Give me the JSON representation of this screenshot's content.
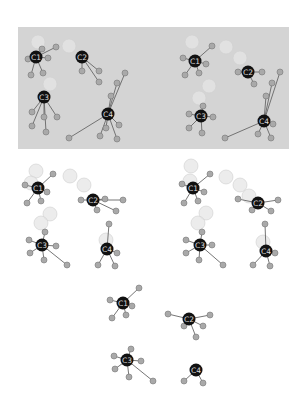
{
  "colors": {
    "panel_bg": "#d4d4d4",
    "center_node": "#111111",
    "leaf_node": "#a9a9a9",
    "leaf_stroke": "#777777",
    "edge": "#666666",
    "ghost_node": "#e6e6e6",
    "label": "#dddddd"
  },
  "clusters": [
    {
      "panel": "top-left",
      "label": "C1",
      "cx": 36,
      "cy": 57,
      "ghost": [
        [
          38,
          42
        ]
      ],
      "leaves": [
        [
          56,
          47
        ],
        [
          28,
          59
        ],
        [
          48,
          58
        ],
        [
          31,
          75
        ],
        [
          43,
          73
        ],
        [
          42,
          49
        ]
      ]
    },
    {
      "panel": "top-left",
      "label": "C2",
      "cx": 82,
      "cy": 57,
      "ghost": [
        [
          69,
          46
        ]
      ],
      "leaves": [
        [
          82,
          71
        ],
        [
          99,
          71
        ],
        [
          99,
          82
        ]
      ]
    },
    {
      "panel": "top-left",
      "label": "C3",
      "cx": 44,
      "cy": 97,
      "ghost": [
        [
          50,
          84
        ]
      ],
      "leaves": [
        [
          32,
          112
        ],
        [
          44,
          117
        ],
        [
          57,
          117
        ],
        [
          32,
          126
        ],
        [
          46,
          132
        ]
      ]
    },
    {
      "panel": "top-left",
      "label": "C4",
      "cx": 108,
      "cy": 114,
      "ghost": [],
      "leaves": [
        [
          125,
          73
        ],
        [
          117,
          83
        ],
        [
          111,
          96
        ],
        [
          69,
          138
        ],
        [
          100,
          136
        ],
        [
          106,
          128
        ],
        [
          119,
          125
        ],
        [
          117,
          139
        ]
      ]
    },
    {
      "panel": "top-right",
      "label": "C1",
      "cx": 195,
      "cy": 61,
      "ghost": [
        [
          192,
          42
        ],
        [
          226,
          47
        ]
      ],
      "leaves": [
        [
          212,
          46
        ],
        [
          183,
          58
        ],
        [
          206,
          64
        ],
        [
          185,
          75
        ],
        [
          199,
          73
        ]
      ]
    },
    {
      "panel": "top-right",
      "label": "C2",
      "cx": 248,
      "cy": 72,
      "ghost": [
        [
          240,
          58
        ]
      ],
      "leaves": [
        [
          238,
          72
        ],
        [
          262,
          72
        ],
        [
          254,
          84
        ]
      ]
    },
    {
      "panel": "top-right",
      "label": "C3",
      "cx": 201,
      "cy": 116,
      "ghost": [
        [
          209,
          86
        ],
        [
          199,
          98
        ]
      ],
      "leaves": [
        [
          203,
          106
        ],
        [
          189,
          114
        ],
        [
          213,
          117
        ],
        [
          189,
          128
        ],
        [
          202,
          133
        ]
      ]
    },
    {
      "panel": "top-right",
      "label": "C4",
      "cx": 264,
      "cy": 121,
      "ghost": [],
      "leaves": [
        [
          280,
          72
        ],
        [
          272,
          83
        ],
        [
          266,
          96
        ],
        [
          225,
          138
        ],
        [
          258,
          134
        ],
        [
          273,
          124
        ],
        [
          271,
          138
        ]
      ]
    },
    {
      "panel": "mid-left",
      "label": "C1",
      "cx": 38,
      "cy": 188,
      "ghost": [
        [
          36,
          171
        ],
        [
          31,
          183
        ]
      ],
      "leaves": [
        [
          53,
          174
        ],
        [
          25,
          185
        ],
        [
          47,
          192
        ],
        [
          27,
          203
        ],
        [
          41,
          201
        ]
      ]
    },
    {
      "panel": "mid-left",
      "label": "C2",
      "cx": 93,
      "cy": 200,
      "ghost": [
        [
          70,
          176
        ],
        [
          84,
          185
        ]
      ],
      "leaves": [
        [
          81,
          200
        ],
        [
          105,
          199
        ],
        [
          123,
          200
        ],
        [
          97,
          210
        ],
        [
          116,
          211
        ]
      ]
    },
    {
      "panel": "mid-left",
      "label": "C3",
      "cx": 42,
      "cy": 245,
      "ghost": [
        [
          50,
          214
        ],
        [
          41,
          223
        ]
      ],
      "leaves": [
        [
          45,
          232
        ],
        [
          29,
          240
        ],
        [
          56,
          246
        ],
        [
          30,
          253
        ],
        [
          44,
          260
        ],
        [
          67,
          265
        ]
      ]
    },
    {
      "panel": "mid-left",
      "label": "C4",
      "cx": 107,
      "cy": 249,
      "ghost": [
        [
          106,
          240
        ]
      ],
      "leaves": [
        [
          109,
          224
        ],
        [
          117,
          253
        ],
        [
          98,
          265
        ],
        [
          115,
          266
        ]
      ]
    },
    {
      "panel": "mid-right",
      "label": "C1",
      "cx": 193,
      "cy": 188,
      "ghost": [
        [
          191,
          166
        ],
        [
          190,
          181
        ]
      ],
      "leaves": [
        [
          210,
          174
        ],
        [
          182,
          184
        ],
        [
          204,
          192
        ],
        [
          184,
          203
        ],
        [
          198,
          201
        ]
      ]
    },
    {
      "panel": "mid-right",
      "label": "C2",
      "cx": 258,
      "cy": 203,
      "ghost": [
        [
          226,
          177
        ],
        [
          240,
          185
        ],
        [
          249,
          196
        ]
      ],
      "leaves": [
        [
          238,
          199
        ],
        [
          278,
          200
        ],
        [
          252,
          210
        ],
        [
          271,
          211
        ]
      ]
    },
    {
      "panel": "mid-right",
      "label": "C3",
      "cx": 200,
      "cy": 245,
      "ghost": [
        [
          206,
          213
        ],
        [
          198,
          223
        ]
      ],
      "leaves": [
        [
          202,
          232
        ],
        [
          186,
          240
        ],
        [
          212,
          245
        ],
        [
          186,
          253
        ],
        [
          199,
          260
        ],
        [
          223,
          265
        ]
      ]
    },
    {
      "panel": "mid-right",
      "label": "C4",
      "cx": 266,
      "cy": 251,
      "ghost": [
        [
          263,
          242
        ]
      ],
      "leaves": [
        [
          265,
          224
        ],
        [
          275,
          253
        ],
        [
          253,
          265
        ],
        [
          270,
          266
        ]
      ]
    },
    {
      "panel": "bottom",
      "label": "C1",
      "cx": 123,
      "cy": 303,
      "ghost": [],
      "leaves": [
        [
          139,
          288
        ],
        [
          110,
          300
        ],
        [
          132,
          306
        ],
        [
          112,
          318
        ],
        [
          126,
          315
        ]
      ]
    },
    {
      "panel": "bottom",
      "label": "C2",
      "cx": 189,
      "cy": 319,
      "ghost": [],
      "leaves": [
        [
          168,
          314
        ],
        [
          210,
          315
        ],
        [
          184,
          326
        ],
        [
          203,
          326
        ],
        [
          196,
          337
        ]
      ]
    },
    {
      "panel": "bottom",
      "label": "C3",
      "cx": 127,
      "cy": 360,
      "ghost": [],
      "leaves": [
        [
          131,
          349
        ],
        [
          114,
          356
        ],
        [
          141,
          361
        ],
        [
          115,
          369
        ],
        [
          129,
          377
        ],
        [
          153,
          381
        ]
      ]
    },
    {
      "panel": "bottom",
      "label": "C4",
      "cx": 196,
      "cy": 370,
      "ghost": [],
      "leaves": [
        [
          184,
          381
        ],
        [
          203,
          383
        ]
      ]
    }
  ]
}
